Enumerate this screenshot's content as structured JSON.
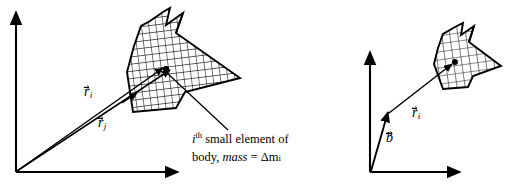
{
  "figure": {
    "title_text": "",
    "stroke_color": "#000000",
    "fill_color": "#ffffff",
    "background": "#ffffff",
    "hatch_style": "cross-hatch-grid"
  },
  "left_panel": {
    "name": "position-vectors-from-origin",
    "axes": {
      "vertical_label": "",
      "horizontal_label": "",
      "origin": [
        16,
        172
      ]
    },
    "vectors": [
      {
        "id": "r_i",
        "symbol": "r",
        "subscript": "i",
        "accent": "arrow",
        "label_x": 86,
        "label_y": 92
      },
      {
        "id": "r_j",
        "symbol": "r",
        "subscript": "j",
        "accent": "arrow",
        "label_x": 100,
        "label_y": 123
      }
    ],
    "point_mass_marker": "filled-dot",
    "annotation": {
      "line1_prefix": "i",
      "line1_superscript": "th",
      "line1_rest": " small element of",
      "line2_prefix": "body, ",
      "line2_italic": "mass",
      "line2_rest": " = Δm",
      "line2_subscript": "i"
    }
  },
  "right_panel": {
    "name": "position-vector-from-base-point",
    "axes": {
      "vertical_label": "",
      "horizontal_label": "",
      "origin": [
        370,
        172
      ]
    },
    "vectors": [
      {
        "id": "b",
        "symbol": "b",
        "subscript": "",
        "accent": "arrow",
        "label_x": 386,
        "label_y": 138
      },
      {
        "id": "r_i",
        "symbol": "r",
        "subscript": "i",
        "accent": "arrow",
        "label_x": 413,
        "label_y": 113
      }
    ],
    "point_mass_marker": "filled-dot"
  }
}
